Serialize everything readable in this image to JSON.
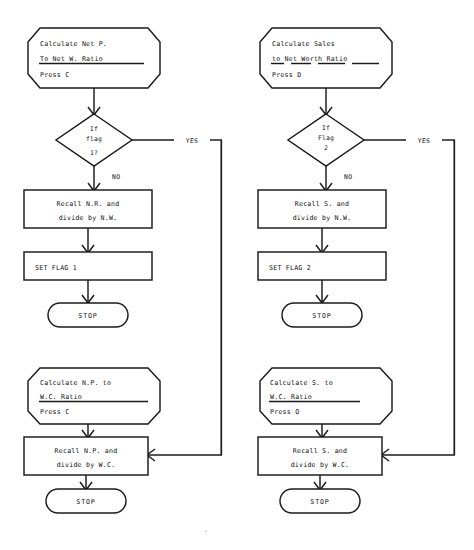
{
  "document": {
    "type": "flowchart",
    "title": "Financial Ratio Calculation Flowchart",
    "columns": 2,
    "background_color": "#ffffff",
    "line_color": "#1a1a1a",
    "text_color": "#101010"
  },
  "left_column": {
    "input_box_1": {
      "shape": "hexagon",
      "line1": "Calculate Net P.",
      "line2": "To Net W. Ratio",
      "line2_underlined": true,
      "line3": "Press C"
    },
    "decision_1": {
      "shape": "diamond",
      "line1": "If",
      "line2": "flag",
      "line3": "1?",
      "yes_label": "YES",
      "no_label": "NO"
    },
    "process_1": {
      "shape": "rectangle",
      "line1": "Recall N.R. and",
      "line2": "divide by N.W."
    },
    "process_2": {
      "shape": "rectangle",
      "line1": "SET FLAG 1"
    },
    "terminator_1": {
      "shape": "rounded",
      "label": "STOP"
    },
    "input_box_2": {
      "shape": "hexagon",
      "line1": "Calculate N.P. to",
      "line2": "W.C. Ratio",
      "line2_underlined": true,
      "line3": "Press C"
    },
    "process_3": {
      "shape": "rectangle",
      "line1": "Recall N.P. and",
      "line2": "divide by W.C."
    },
    "terminator_2": {
      "shape": "rounded",
      "label": "STOP"
    }
  },
  "right_column": {
    "input_box_1": {
      "shape": "hexagon",
      "line1": "Calculate Sales",
      "line2_words": [
        "to",
        "Net",
        "Worth",
        "Ratio"
      ],
      "line2": "to Net Worth Ratio",
      "line2_underlined": true,
      "line3": "Press D"
    },
    "decision_1": {
      "shape": "diamond",
      "line1": "If",
      "line2": "Flag",
      "line3": "2",
      "yes_label": "YES",
      "no_label": "NO"
    },
    "process_1": {
      "shape": "rectangle",
      "line1": "Recall S. and",
      "line2": "divide by N.W."
    },
    "process_2": {
      "shape": "rectangle",
      "line1": "SET FLAG 2"
    },
    "terminator_1": {
      "shape": "rounded",
      "label": "STOP"
    },
    "input_box_2": {
      "shape": "hexagon",
      "line1": "Calculate S. to",
      "line2": "W.C. Ratio",
      "line2_underlined": true,
      "line3": "Press O"
    },
    "process_3": {
      "shape": "rectangle",
      "line1": "Recall S. and",
      "line2": "divide by W.C."
    },
    "terminator_2": {
      "shape": "rounded",
      "label": "STOP"
    }
  }
}
